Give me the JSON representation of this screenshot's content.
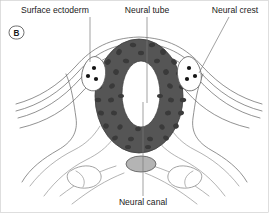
{
  "figure": {
    "panel_letter": "B",
    "title_caption": "",
    "background_color": "#ffffff"
  },
  "labels": [
    {
      "id": "surface-ectoderm",
      "text": "Surface ectoderm",
      "x": 16,
      "y": 12,
      "anchor": "start"
    },
    {
      "id": "neural-tube",
      "text": "Neural tube",
      "x": 133,
      "y": 12,
      "anchor": "middle"
    },
    {
      "id": "neural-crest",
      "text": "Neural crest",
      "x": 241,
      "y": 12,
      "anchor": "middle"
    },
    {
      "id": "neural-canal",
      "text": "Neural canal",
      "x": 143,
      "y": 206,
      "anchor": "middle"
    }
  ],
  "structures": {
    "neural_tube": {
      "name": "Neural tube",
      "fill_color": "#555555",
      "stroke_color": "#3c3c3c",
      "center_x": 139,
      "center_y": 96,
      "radius_x": 44,
      "radius_y": 57
    },
    "neural_canal": {
      "name": "Neural canal",
      "fill_color": "#ffffff",
      "center_x": 141,
      "center_y": 94,
      "radius_x": 19,
      "radius_y": 33
    },
    "neural_crest_left": {
      "name": "Neural crest (left)",
      "fill_color": "#ffffff",
      "cell_color": "#141414",
      "cell_count": 3
    },
    "neural_crest_right": {
      "name": "Neural crest (right)",
      "fill_color": "#ffffff",
      "cell_color": "#141414",
      "cell_count": 3
    },
    "notochord": {
      "name": "Notochord",
      "fill_color": "#b4b4b4",
      "stroke_color": "#555555",
      "center_x": 141,
      "center_y": 164,
      "radius_x": 15,
      "radius_y": 8
    },
    "dorsal_aorta_left": {
      "name": "Dorsal aorta (left)",
      "fill_color": "#ffffff"
    },
    "dorsal_aorta_right": {
      "name": "Dorsal aorta (right)",
      "fill_color": "#ffffff"
    },
    "surface_ectoderm": {
      "name": "Surface ectoderm",
      "stroke_color": "#6e6e6e",
      "layer_count": 3
    }
  },
  "colors": {
    "neural_tube_gray": "#555555",
    "nucleus_gray": "#3a3a3a",
    "notochord_gray": "#b4b4b4",
    "outline_gray": "#6e6e6e",
    "text_color": "#1a1a1a",
    "leader_color": "#7a7a7a"
  }
}
